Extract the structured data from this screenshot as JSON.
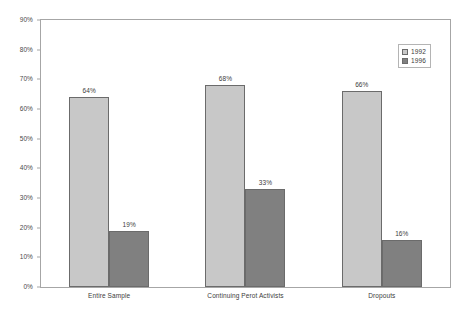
{
  "chart_data": {
    "type": "bar",
    "title": "",
    "subtitle": "",
    "xlabel": "",
    "ylabel": "",
    "categories": [
      "Entire Sample",
      "Continuing Perot Activists",
      "Dropouts"
    ],
    "series": [
      {
        "name": "1992",
        "color": "#c8c8c8",
        "values": [
          64,
          68,
          66
        ],
        "labels": [
          "64%",
          "68%",
          "66%"
        ]
      },
      {
        "name": "1996",
        "color": "#808080",
        "values": [
          19,
          33,
          16
        ],
        "labels": [
          "19%",
          "33%",
          "16%"
        ]
      }
    ],
    "ylim": [
      0,
      90
    ],
    "ytick_values": [
      0,
      10,
      20,
      30,
      40,
      50,
      60,
      70,
      80,
      90
    ],
    "ytick_labels": [
      "0%",
      "10%",
      "20%",
      "30%",
      "40%",
      "50%",
      "60%",
      "70%",
      "80%",
      "90%"
    ],
    "grid": false,
    "legend_position": "top-right",
    "value_labels_shown": true,
    "plot_background": "#ffffff",
    "border_color": "#a6a6a6"
  }
}
